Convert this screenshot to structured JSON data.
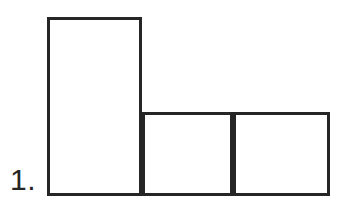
{
  "page": {
    "background_color": "#ffffff",
    "width": 354,
    "height": 211
  },
  "label": {
    "text": "1.",
    "color": "#262626"
  },
  "figure": {
    "name": "l-shaped-composite-rectangles",
    "stroke_color": "#262626",
    "fill_color": "#ffffff",
    "stroke_width": 3,
    "parts": [
      {
        "name": "tall-left-rectangle",
        "x": 47,
        "y": 17,
        "width": 95,
        "height": 179
      },
      {
        "name": "middle-square",
        "x": 142,
        "y": 112,
        "width": 91,
        "height": 84
      },
      {
        "name": "right-square",
        "x": 233,
        "y": 112,
        "width": 97,
        "height": 84
      }
    ],
    "divider": {
      "name": "interior-vertical-divider",
      "x": 233,
      "y1": 112,
      "y2": 196
    }
  }
}
